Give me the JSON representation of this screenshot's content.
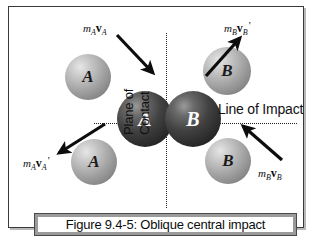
{
  "figure": {
    "caption": "Figure 9.4-5: Oblique central impact",
    "line_of_impact_label": "Line of Impact",
    "plane_of_contact_line1": "Plane of",
    "plane_of_contact_line2": "Contact",
    "border_color": "#3a3a3a",
    "guide_line_color": "#1d1d1d",
    "caption_border_color": "#9b9b9b"
  },
  "spheres": [
    {
      "id": "incoming-a",
      "label": "A",
      "shade": "light",
      "x": 56,
      "y": 47,
      "d": 46
    },
    {
      "id": "incoming-b",
      "label": "B",
      "shade": "light",
      "x": 194,
      "y": 40,
      "d": 48
    },
    {
      "id": "contact-a",
      "label": "A",
      "shade": "dark",
      "x": 108,
      "y": 84,
      "d": 56
    },
    {
      "id": "contact-b",
      "label": "B",
      "shade": "dark",
      "x": 156,
      "y": 84,
      "d": 56
    },
    {
      "id": "outgoing-a",
      "label": "A",
      "shade": "light",
      "x": 62,
      "y": 132,
      "d": 46
    },
    {
      "id": "outgoing-b",
      "label": "B",
      "shade": "light",
      "x": 196,
      "y": 131,
      "d": 46
    }
  ],
  "vectors": [
    {
      "id": "m-a-v-a",
      "mass": "m",
      "mass_sub": "A",
      "vec": "v",
      "vec_sub": "A",
      "prime": "",
      "label_x": 74,
      "label_y": 12,
      "arrow": {
        "x1": 108,
        "y1": 28,
        "x2": 144,
        "y2": 66
      }
    },
    {
      "id": "m-b-v-b-prime",
      "mass": "m",
      "mass_sub": "B",
      "vec": "v",
      "vec_sub": "B",
      "prime": "'",
      "label_x": 215,
      "label_y": 12,
      "arrow": {
        "x1": 197,
        "y1": 69,
        "x2": 231,
        "y2": 31
      }
    },
    {
      "id": "m-a-v-a-prime",
      "mass": "m",
      "mass_sub": "A",
      "vec": "v",
      "vec_sub": "A",
      "prime": "'",
      "label_x": 14,
      "label_y": 147,
      "arrow": {
        "x1": 96,
        "y1": 117,
        "x2": 50,
        "y2": 146
      }
    },
    {
      "id": "m-b-v-b",
      "mass": "m",
      "mass_sub": "B",
      "vec": "v",
      "vec_sub": "B",
      "prime": "",
      "label_x": 249,
      "label_y": 157,
      "arrow": {
        "x1": 273,
        "y1": 153,
        "x2": 234,
        "y2": 119
      }
    }
  ]
}
